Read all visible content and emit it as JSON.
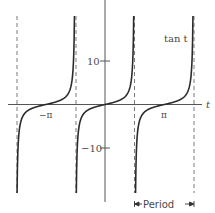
{
  "chart_data": {
    "type": "line",
    "title": "",
    "function": "tan t",
    "xlabel": "t",
    "ylabel": "",
    "series": [
      {
        "name": "tan t",
        "branch_centers": [
          "-π",
          "0",
          "π"
        ],
        "x": [
          -1.45,
          -1.3,
          -1.0,
          -0.7,
          -0.4,
          0,
          0.4,
          0.7,
          1.0,
          1.3,
          1.45
        ],
        "y": [
          -8.2,
          -3.6,
          -1.56,
          -0.84,
          -0.42,
          0,
          0.42,
          0.84,
          1.56,
          3.6,
          8.2
        ]
      }
    ],
    "asymptotes": [
      "-3π/2",
      "-π/2",
      "π/2",
      "3π/2"
    ],
    "x_ticks": [
      {
        "value": "-π",
        "label": "−π"
      },
      {
        "value": "π",
        "label": "π"
      }
    ],
    "y_ticks": [
      {
        "value": 10,
        "label": "10"
      },
      {
        "value": -10,
        "label": "−10"
      }
    ],
    "ylim": [
      -20,
      20
    ],
    "xlim": [
      "-5π/3",
      "5π/3"
    ],
    "grid": false,
    "legend": "none",
    "annotations": [
      {
        "text": "tan t",
        "position": "upper right"
      },
      {
        "text": "Period",
        "type": "double-arrow",
        "span": [
          "π/2",
          "3π/2"
        ]
      }
    ],
    "colors": {
      "curve": "#2b2b2b",
      "axis": "#555555",
      "asymptote": "#777777",
      "text": "#4a4a4a"
    }
  },
  "labels": {
    "func": "tan t",
    "t_axis": "t",
    "tick_pos10": "10",
    "tick_neg10": "−10",
    "neg_pi": "−π",
    "pi": "π",
    "period": "Period"
  }
}
